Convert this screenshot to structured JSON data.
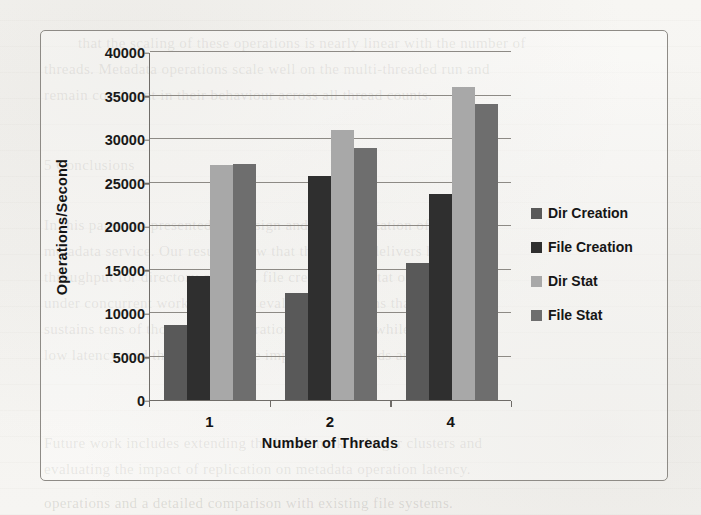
{
  "chart_data": {
    "type": "bar",
    "title": "",
    "xlabel": "Number of Threads",
    "ylabel": "Operations/Second",
    "categories": [
      "1",
      "2",
      "4"
    ],
    "ylim": [
      0,
      40000
    ],
    "ytick_values": [
      0,
      5000,
      10000,
      15000,
      20000,
      25000,
      30000,
      35000,
      40000
    ],
    "ytick_labels": [
      "0",
      "5000",
      "10000",
      "15000",
      "20000",
      "25000",
      "30000",
      "35000",
      "40000"
    ],
    "grid": "horizontal",
    "legend_position": "right",
    "series": [
      {
        "name": "Dir Creation",
        "color": "#595959",
        "values": [
          8600,
          12300,
          15700
        ]
      },
      {
        "name": "File Creation",
        "color": "#2f2f2f",
        "values": [
          14300,
          25700,
          23700
        ]
      },
      {
        "name": "Dir Stat",
        "color": "#a8a8a8",
        "values": [
          27000,
          31000,
          36000
        ]
      },
      {
        "name": "File Stat",
        "color": "#6e6e6e",
        "values": [
          27100,
          29000,
          34000
        ]
      }
    ]
  },
  "figure": {
    "frame_color": "#8e8b86",
    "axis_color": "#6f6c68",
    "grid_color": "#8d8a85",
    "background_color": "#f6f5f2",
    "text_color": "#141414"
  },
  "page_ghost_text": [
    {
      "text": "that the scaling of these operations is nearly linear with the number of",
      "x": 78,
      "y": 30
    },
    {
      "text": "threads. Metadata operations scale well on the multi-threaded run and",
      "x": 44,
      "y": 56
    },
    {
      "text": "remain consistent in their behaviour across all thread counts.",
      "x": 44,
      "y": 82
    },
    {
      "text": "5 Conclusions",
      "x": 44,
      "y": 152
    },
    {
      "text": "In this paper we presented the design and implementation of a scalable",
      "x": 44,
      "y": 212
    },
    {
      "text": "metadata service. Our results show that the system delivers high",
      "x": 44,
      "y": 238
    },
    {
      "text": "throughput for directory creation, file creation and stat operations",
      "x": 44,
      "y": 264
    },
    {
      "text": "under concurrent workloads. The evaluation confirms that the service",
      "x": 44,
      "y": 290
    },
    {
      "text": "sustains tens of thousands of operations per second while maintaining",
      "x": 44,
      "y": 316
    },
    {
      "text": "low latency, and that performance improves as threads are added.",
      "x": 44,
      "y": 342
    },
    {
      "text": "Future work includes extending the benchmark to larger clusters and",
      "x": 44,
      "y": 430
    },
    {
      "text": "evaluating the impact of replication on metadata operation latency.",
      "x": 44,
      "y": 456
    },
    {
      "text": "operations and a detailed comparison with existing file systems.",
      "x": 44,
      "y": 490
    }
  ]
}
